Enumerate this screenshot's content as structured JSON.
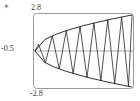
{
  "figure": {
    "corner_mark": "✦",
    "background_color": "#ffffff",
    "frame_color": "#9a9a9a",
    "axis_color": "#a8a8a8",
    "curve_color": "#1a1a1a"
  },
  "labels": {
    "top": "2.8",
    "bottom": "-2.8",
    "left": "-0.5"
  },
  "chart_data": {
    "type": "line",
    "title": "",
    "xlabel": "",
    "ylabel": "",
    "xlim": [
      -0.5,
      2.8
    ],
    "ylim": [
      -2.8,
      2.8
    ],
    "grid": false,
    "legend": null,
    "annotations": [
      {
        "text": "2.8",
        "position": "top-left-axis-tick"
      },
      {
        "text": "-2.8",
        "position": "bottom-left-axis-tick"
      },
      {
        "text": "-0.5",
        "position": "left-axis-tick"
      }
    ],
    "series": [
      {
        "name": "upper-envelope",
        "kind": "envelope",
        "x": [
          -0.5,
          -0.17,
          0.16,
          0.49,
          0.82,
          1.15,
          1.48,
          1.81,
          2.14,
          2.47,
          2.8
        ],
        "y": [
          0.0,
          1.02,
          1.44,
          1.76,
          2.03,
          2.27,
          2.49,
          2.69,
          2.88,
          3.06,
          3.23
        ]
      },
      {
        "name": "lower-envelope",
        "kind": "envelope",
        "x": [
          -0.5,
          -0.17,
          0.16,
          0.49,
          0.82,
          1.15,
          1.48,
          1.81,
          2.14,
          2.47,
          2.8
        ],
        "y": [
          0.0,
          -1.02,
          -1.44,
          -1.76,
          -2.03,
          -2.27,
          -2.49,
          -2.69,
          -2.88,
          -3.06,
          -3.23
        ]
      },
      {
        "name": "oscillation",
        "kind": "zigzag",
        "peak_count": 7,
        "trough_count": 7,
        "x_start": -0.5,
        "x_end": 2.8,
        "note": "zigzag vertices alternately touch the upper and lower envelope"
      }
    ]
  }
}
